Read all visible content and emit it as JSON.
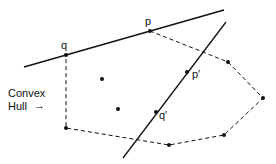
{
  "labels": {
    "p": "p",
    "q": "q",
    "p_prime": "p′",
    "q_prime": "q′",
    "hull_line1": "Convex",
    "hull_line2": "Hull"
  },
  "hull_arrow": "→",
  "points": {
    "q": [
      66,
      55
    ],
    "p": [
      150,
      31
    ],
    "h3": [
      228,
      62
    ],
    "h4": [
      263,
      98
    ],
    "h5": [
      224,
      135
    ],
    "h6": [
      169,
      145
    ],
    "h7": [
      66,
      128
    ],
    "i1": [
      102,
      79
    ],
    "i2": [
      118,
      109
    ],
    "p_prime": [
      187,
      72
    ],
    "q_prime": [
      156,
      112
    ]
  }
}
